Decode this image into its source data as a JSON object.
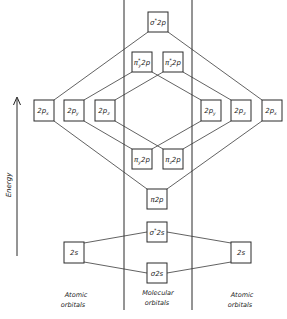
{
  "diagram": {
    "axis": {
      "label": "Energy",
      "direction": "up"
    },
    "columns": {
      "left": {
        "line1": "Atomic",
        "line2": "orbitals"
      },
      "center": {
        "line1": "Molecular",
        "line2": "orbitals"
      },
      "right": {
        "line1": "Atomic",
        "line2": "orbitals"
      }
    },
    "atomic_left": {
      "2px": {
        "main": "2p",
        "sub": "x"
      },
      "2py": {
        "main": "2p",
        "sub": "y"
      },
      "2pz": {
        "main": "2p",
        "sub": "z"
      },
      "2s": {
        "main": "2s"
      }
    },
    "atomic_right": {
      "2py": {
        "main": "2p",
        "sub": "y"
      },
      "2pz": {
        "main": "2p",
        "sub": "z"
      },
      "2px": {
        "main": "2p",
        "sub": "x"
      },
      "2s": {
        "main": "2s"
      }
    },
    "molecular": {
      "sigma_star_2p": {
        "sym": "σ",
        "star": "*",
        "rest": "2p"
      },
      "pi_star_y_2p": {
        "sym": "π",
        "star": "*",
        "sub": "y",
        "rest": "2p"
      },
      "pi_star_z_2p": {
        "sym": "π",
        "star": "*",
        "sub": "z",
        "rest": "2p"
      },
      "pi_y_2p": {
        "sym": "π",
        "sub": "y",
        "rest": "2p"
      },
      "pi_z_2p": {
        "sym": "π",
        "sub": "z",
        "rest": "2p"
      },
      "sigma_2p": {
        "sym": "π",
        "rest": "2p"
      },
      "sigma_star_2s": {
        "sym": "σ",
        "star": "*",
        "rest": "2s"
      },
      "sigma_2s": {
        "sym": "σ",
        "rest": "2s"
      }
    }
  }
}
